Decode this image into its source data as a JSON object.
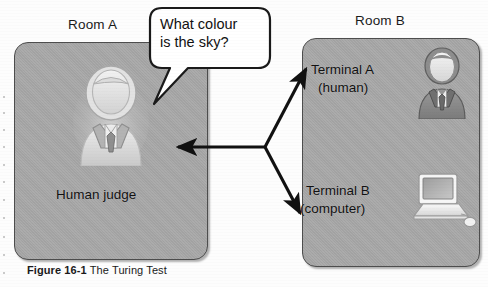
{
  "figure": {
    "caption_bold": "Figure 16-1",
    "caption_rest": " The Turing Test"
  },
  "rooms": {
    "a": {
      "label": "Room A",
      "occupant_label": "Human judge"
    },
    "b": {
      "label": "Room B",
      "terminal_a_line1": "Terminal A",
      "terminal_a_line2": "(human)",
      "terminal_b_line1": "Terminal B",
      "terminal_b_line2": "(computer)"
    }
  },
  "speech": {
    "line1": "What colour",
    "line2": "is the sky?"
  },
  "icons": {
    "judge": "person-icon",
    "human_terminal": "person-icon",
    "computer_terminal": "laptop-icon"
  },
  "colors": {
    "room_fill": "#a8a8a8",
    "room_border": "#4d4d4d",
    "line": "#111111",
    "bubble_fill": "#ffffff",
    "text": "#111111",
    "judge_icon": "#e4e4e4",
    "human_b_icon": "#8c8c8c"
  }
}
